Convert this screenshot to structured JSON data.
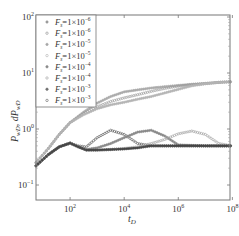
{
  "chart_data": {
    "type": "scatter",
    "title": "",
    "xlabel": "t_D",
    "ylabel": "P_wD, dP_wD",
    "xscale": "log",
    "yscale": "log",
    "xlim": [
      5.5,
      100000000
    ],
    "ylim": [
      0.053,
      112
    ],
    "x_ticks": [
      "10^2",
      "10^4",
      "10^6",
      "10^8"
    ],
    "y_ticks": [
      "10^-1",
      "10^0",
      "10^1",
      "10^2"
    ],
    "grid": false,
    "legend_position": "upper left",
    "legend": [
      {
        "label": "F_s=1×10^-6",
        "marker": "circle",
        "color": "#9a9a9a"
      },
      {
        "label": "F_s=1×10^-6",
        "marker": "circle-open",
        "color": "#8a8a8a"
      },
      {
        "label": "F_s=1×10^-5",
        "marker": "circle",
        "color": "#a8a8a8"
      },
      {
        "label": "F_s=1×10^-5",
        "marker": "circle-open",
        "color": "#b0b0b0"
      },
      {
        "label": "F_s=1×10^-4",
        "marker": "circle",
        "color": "#8c8c8c"
      },
      {
        "label": "F_s=1×10^-4",
        "marker": "circle-open",
        "color": "#9c9c9c"
      },
      {
        "label": "F_s=1×10^-3",
        "marker": "circle",
        "color": "#707070"
      },
      {
        "label": "F_s=1×10^-3",
        "marker": "circle-open",
        "color": "#606060"
      }
    ],
    "series": [
      {
        "name": "P_wD (upper group A)",
        "x_log": [
          0.74,
          1.2,
          1.6,
          2.0,
          2.5,
          3.0,
          3.5,
          4.0,
          4.5,
          5.0,
          5.5,
          6.0,
          6.5,
          7.0,
          7.5,
          8.0
        ],
        "values": [
          0.25,
          0.45,
          0.8,
          1.3,
          2.0,
          2.9,
          3.8,
          4.6,
          5.0,
          5.4,
          5.7,
          6.0,
          6.3,
          6.5,
          6.8,
          7.0
        ]
      },
      {
        "name": "P_wD (upper group B)",
        "x_log": [
          0.74,
          1.2,
          1.6,
          2.0,
          2.5,
          3.0,
          3.5,
          4.0,
          4.5,
          5.0,
          5.5,
          6.0,
          6.5,
          7.0,
          7.5,
          8.0
        ],
        "values": [
          0.25,
          0.45,
          0.8,
          1.3,
          1.9,
          2.5,
          3.1,
          3.6,
          4.1,
          4.7,
          5.3,
          5.8,
          6.2,
          6.5,
          6.8,
          7.0
        ]
      },
      {
        "name": "P_wD (upper group C)",
        "x_log": [
          0.74,
          1.2,
          1.6,
          2.0,
          2.5,
          3.0,
          3.5,
          4.0,
          4.5,
          5.0,
          5.5,
          6.0,
          6.5,
          7.0,
          7.5,
          8.0
        ],
        "values": [
          0.25,
          0.45,
          0.8,
          1.3,
          1.8,
          2.3,
          2.7,
          3.0,
          3.4,
          3.8,
          4.4,
          5.1,
          5.9,
          6.4,
          6.8,
          7.0
        ]
      },
      {
        "name": "dP_wD (hump at 10^3.5)",
        "x_log": [
          0.74,
          1.2,
          1.6,
          2.0,
          2.3,
          2.6,
          3.0,
          3.5,
          4.0,
          4.5,
          5.0,
          5.5,
          6.0,
          7.0,
          8.0
        ],
        "values": [
          0.22,
          0.35,
          0.48,
          0.56,
          0.5,
          0.48,
          0.7,
          0.95,
          0.8,
          0.55,
          0.5,
          0.5,
          0.5,
          0.5,
          0.5
        ]
      },
      {
        "name": "dP_wD (hump at 10^5)",
        "x_log": [
          0.74,
          1.2,
          1.6,
          2.0,
          2.3,
          2.6,
          3.0,
          3.5,
          4.0,
          4.5,
          5.0,
          5.5,
          6.0,
          7.0,
          8.0
        ],
        "values": [
          0.22,
          0.35,
          0.48,
          0.56,
          0.48,
          0.43,
          0.46,
          0.55,
          0.7,
          0.88,
          0.95,
          0.75,
          0.52,
          0.5,
          0.5
        ]
      },
      {
        "name": "dP_wD (hump at 10^6.5)",
        "x_log": [
          0.74,
          1.2,
          1.6,
          2.0,
          2.3,
          2.6,
          3.0,
          3.5,
          4.0,
          4.5,
          5.0,
          5.5,
          6.0,
          6.5,
          7.0,
          7.5,
          8.0
        ],
        "values": [
          0.22,
          0.35,
          0.48,
          0.56,
          0.48,
          0.42,
          0.42,
          0.43,
          0.45,
          0.48,
          0.55,
          0.65,
          0.82,
          0.92,
          0.8,
          0.55,
          0.5
        ]
      },
      {
        "name": "dP_wD (flat)",
        "x_log": [
          0.74,
          1.2,
          1.6,
          2.0,
          2.3,
          2.6,
          3.0,
          3.5,
          4.0,
          4.5,
          5.0,
          5.5,
          6.0,
          7.0,
          8.0
        ],
        "values": [
          0.22,
          0.35,
          0.48,
          0.56,
          0.48,
          0.42,
          0.42,
          0.43,
          0.44,
          0.46,
          0.5,
          0.5,
          0.5,
          0.5,
          0.5
        ]
      }
    ]
  }
}
